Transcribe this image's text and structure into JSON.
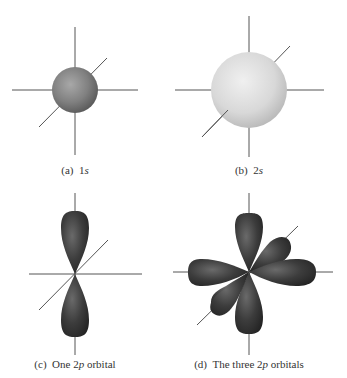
{
  "figure": {
    "panels": [
      {
        "id": "a",
        "label": "(a)",
        "orbital_prefix": "1",
        "orbital_italic": "s",
        "orbital_suffix": "",
        "shape": "sphere",
        "size": "small",
        "fill_color": "#8a8a8a"
      },
      {
        "id": "b",
        "label": "(b)",
        "orbital_prefix": "2",
        "orbital_italic": "s",
        "orbital_suffix": "",
        "shape": "sphere",
        "size": "large",
        "fill_color": "#dcdcdc"
      },
      {
        "id": "c",
        "label": "(c)",
        "orbital_prefix": "One 2",
        "orbital_italic": "p",
        "orbital_suffix": " orbital",
        "shape": "dumbbell",
        "fill_color": "#3a3a3a"
      },
      {
        "id": "d",
        "label": "(d)",
        "orbital_prefix": "The three 2",
        "orbital_italic": "p",
        "orbital_suffix": " orbitals",
        "shape": "three-dumbbells",
        "fill_color": "#3a3a3a"
      }
    ]
  }
}
